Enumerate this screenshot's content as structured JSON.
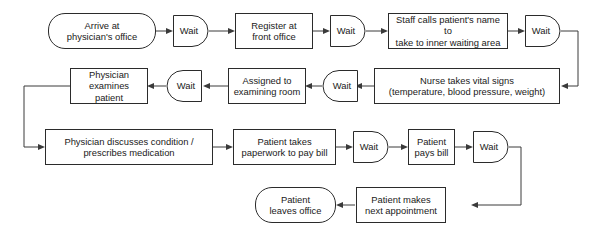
{
  "diagram": {
    "accent": "#2b2b2b",
    "line_color": "#3a3a3a",
    "background": "#ffffff",
    "wait_label": "Wait"
  },
  "nodes": {
    "arrive": {
      "label": "Arrive at\nphysician's office",
      "shape": "terminator"
    },
    "wait1": {
      "label": "Wait",
      "shape": "delay"
    },
    "register": {
      "label": "Register at\nfront office",
      "shape": "process"
    },
    "wait2": {
      "label": "Wait",
      "shape": "delay"
    },
    "staff_calls": {
      "label": "Staff calls patient's name to\ntake to inner waiting area",
      "shape": "process"
    },
    "wait3": {
      "label": "Wait",
      "shape": "delay"
    },
    "nurse_vitals": {
      "label": "Nurse takes vital signs\n(temperature, blood pressure, weight)",
      "shape": "process"
    },
    "wait4": {
      "label": "Wait",
      "shape": "delay"
    },
    "assigned_room": {
      "label": "Assigned to\nexamining room",
      "shape": "process"
    },
    "wait5": {
      "label": "Wait",
      "shape": "delay"
    },
    "physician_examines": {
      "label": "Physician\nexamines patient",
      "shape": "process"
    },
    "physician_discusses": {
      "label": "Physician discusses condition /\nprescribes medication",
      "shape": "process"
    },
    "paperwork": {
      "label": "Patient takes\npaperwork to pay bill",
      "shape": "process"
    },
    "wait6": {
      "label": "Wait",
      "shape": "delay"
    },
    "pays_bill": {
      "label": "Patient\npays bill",
      "shape": "process"
    },
    "wait7": {
      "label": "Wait",
      "shape": "delay"
    },
    "next_appointment": {
      "label": "Patient makes\nnext appointment",
      "shape": "process"
    },
    "leaves_office": {
      "label": "Patient\nleaves office",
      "shape": "terminator"
    }
  },
  "flow_order": [
    "arrive",
    "wait1",
    "register",
    "wait2",
    "staff_calls",
    "wait3",
    "nurse_vitals",
    "wait4",
    "assigned_room",
    "wait5",
    "physician_examines",
    "physician_discusses",
    "paperwork",
    "wait6",
    "pays_bill",
    "wait7",
    "next_appointment",
    "leaves_office"
  ]
}
